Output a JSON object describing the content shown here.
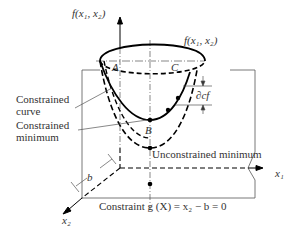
{
  "diagram": {
    "axes": {
      "vertical_label": "f(x₁, x₂)",
      "x1_label": "x₁",
      "x2_label": "x₂"
    },
    "surface_label": "f(x₁, x₂)",
    "points": {
      "A": "A",
      "B": "B",
      "C": "C"
    },
    "labels": {
      "constrained_curve_line1": "Constrained",
      "constrained_curve_line2": "curve",
      "constrained_minimum_line1": "Constrained",
      "constrained_minimum_line2": "minimum",
      "unconstrained_minimum": "Unconstrained minimum",
      "partial_c_f": "∂cf",
      "offset_b": "b",
      "constraint": "Constraint g (X) = x₂ − b = 0"
    },
    "colors": {
      "line": "#000000",
      "text": "#333333",
      "thin": "#555555"
    }
  }
}
